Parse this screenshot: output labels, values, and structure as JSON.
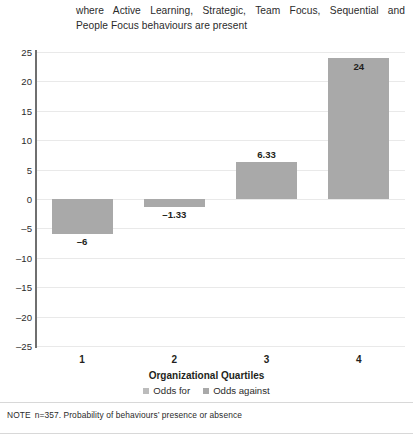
{
  "caption": {
    "line1": "where Active Learning, Strategic, Team Focus, Sequential and",
    "line2": "People Focus behaviours are present"
  },
  "note": {
    "keyword": "NOTE",
    "text": "n=357. Probability of behaviours’ presence or absence"
  },
  "colors": {
    "bar": "#a9a9a9",
    "legend_odds_for": "#bcbcbc",
    "legend_odds_against": "#a9a9a9",
    "axis": "#6f6f6f",
    "grid": "#e9e9e9",
    "text": "#231f20"
  },
  "chart_data": {
    "type": "bar",
    "title": "",
    "xlabel": "Organizational Quartiles",
    "ylabel": "",
    "categories": [
      "1",
      "2",
      "3",
      "4"
    ],
    "values": [
      -6,
      -1.33,
      6.33,
      24
    ],
    "value_labels": [
      "–6",
      "–1.33",
      "6.33",
      "24"
    ],
    "ylim": [
      -25,
      25
    ],
    "yticks": [
      25,
      20,
      15,
      10,
      5,
      0,
      -5,
      -10,
      -15,
      -20,
      -25
    ],
    "ytick_labels": [
      "25",
      "20",
      "15",
      "10",
      "5",
      "0",
      "–5",
      "–10",
      "–15",
      "–20",
      "–25"
    ],
    "grid": true,
    "legend_position": "bottom",
    "legend": [
      {
        "label": "Odds for"
      },
      {
        "label": "Odds against"
      }
    ]
  }
}
